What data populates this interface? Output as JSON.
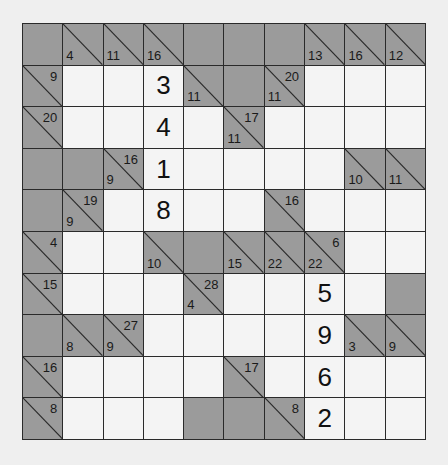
{
  "puzzle": {
    "type": "kakuro",
    "rows": 10,
    "cols": 10,
    "colors": {
      "block": "#9b9b9b",
      "white": "#f4f4f4",
      "lines": "#2a2a2a",
      "background": "#efefef"
    },
    "grid": [
      [
        {
          "t": "b"
        },
        {
          "t": "c",
          "down": "4"
        },
        {
          "t": "c",
          "down": "11"
        },
        {
          "t": "c",
          "down": "16"
        },
        {
          "t": "b"
        },
        {
          "t": "b"
        },
        {
          "t": "b"
        },
        {
          "t": "c",
          "down": "13"
        },
        {
          "t": "c",
          "down": "16"
        },
        {
          "t": "c",
          "down": "12"
        }
      ],
      [
        {
          "t": "c",
          "across": "9"
        },
        {
          "t": "w",
          "v": ""
        },
        {
          "t": "w",
          "v": ""
        },
        {
          "t": "w",
          "v": "3"
        },
        {
          "t": "c",
          "down": "11"
        },
        {
          "t": "b"
        },
        {
          "t": "c",
          "across": "20",
          "down": "11"
        },
        {
          "t": "w",
          "v": ""
        },
        {
          "t": "w",
          "v": ""
        },
        {
          "t": "w",
          "v": ""
        }
      ],
      [
        {
          "t": "c",
          "across": "20"
        },
        {
          "t": "w",
          "v": ""
        },
        {
          "t": "w",
          "v": ""
        },
        {
          "t": "w",
          "v": "4"
        },
        {
          "t": "w",
          "v": ""
        },
        {
          "t": "c",
          "across": "17",
          "down": "11"
        },
        {
          "t": "w",
          "v": ""
        },
        {
          "t": "w",
          "v": ""
        },
        {
          "t": "w",
          "v": ""
        },
        {
          "t": "w",
          "v": ""
        }
      ],
      [
        {
          "t": "b"
        },
        {
          "t": "b"
        },
        {
          "t": "c",
          "across": "16",
          "down": "9"
        },
        {
          "t": "w",
          "v": "1"
        },
        {
          "t": "w",
          "v": ""
        },
        {
          "t": "w",
          "v": ""
        },
        {
          "t": "w",
          "v": ""
        },
        {
          "t": "w",
          "v": ""
        },
        {
          "t": "c",
          "down": "10"
        },
        {
          "t": "c",
          "down": "11"
        }
      ],
      [
        {
          "t": "b"
        },
        {
          "t": "c",
          "across": "19",
          "down": "9"
        },
        {
          "t": "w",
          "v": ""
        },
        {
          "t": "w",
          "v": "8"
        },
        {
          "t": "w",
          "v": ""
        },
        {
          "t": "w",
          "v": ""
        },
        {
          "t": "c",
          "across": "16"
        },
        {
          "t": "w",
          "v": ""
        },
        {
          "t": "w",
          "v": ""
        },
        {
          "t": "w",
          "v": ""
        }
      ],
      [
        {
          "t": "c",
          "across": "4"
        },
        {
          "t": "w",
          "v": ""
        },
        {
          "t": "w",
          "v": ""
        },
        {
          "t": "c",
          "down": "10"
        },
        {
          "t": "b"
        },
        {
          "t": "c",
          "down": "15"
        },
        {
          "t": "c",
          "down": "22"
        },
        {
          "t": "c",
          "across": "6",
          "down": "22"
        },
        {
          "t": "w",
          "v": ""
        },
        {
          "t": "w",
          "v": ""
        }
      ],
      [
        {
          "t": "c",
          "across": "15"
        },
        {
          "t": "w",
          "v": ""
        },
        {
          "t": "w",
          "v": ""
        },
        {
          "t": "w",
          "v": ""
        },
        {
          "t": "c",
          "across": "28",
          "down": "4"
        },
        {
          "t": "w",
          "v": ""
        },
        {
          "t": "w",
          "v": ""
        },
        {
          "t": "w",
          "v": "5"
        },
        {
          "t": "w",
          "v": ""
        },
        {
          "t": "b"
        }
      ],
      [
        {
          "t": "b"
        },
        {
          "t": "c",
          "down": "8"
        },
        {
          "t": "c",
          "across": "27",
          "down": "9"
        },
        {
          "t": "w",
          "v": ""
        },
        {
          "t": "w",
          "v": ""
        },
        {
          "t": "w",
          "v": ""
        },
        {
          "t": "w",
          "v": ""
        },
        {
          "t": "w",
          "v": "9"
        },
        {
          "t": "c",
          "down": "3"
        },
        {
          "t": "c",
          "down": "9"
        }
      ],
      [
        {
          "t": "c",
          "across": "16"
        },
        {
          "t": "w",
          "v": ""
        },
        {
          "t": "w",
          "v": ""
        },
        {
          "t": "w",
          "v": ""
        },
        {
          "t": "w",
          "v": ""
        },
        {
          "t": "c",
          "across": "17"
        },
        {
          "t": "w",
          "v": ""
        },
        {
          "t": "w",
          "v": "6"
        },
        {
          "t": "w",
          "v": ""
        },
        {
          "t": "w",
          "v": ""
        }
      ],
      [
        {
          "t": "c",
          "across": "8"
        },
        {
          "t": "w",
          "v": ""
        },
        {
          "t": "w",
          "v": ""
        },
        {
          "t": "w",
          "v": ""
        },
        {
          "t": "b"
        },
        {
          "t": "b"
        },
        {
          "t": "c",
          "across": "8"
        },
        {
          "t": "w",
          "v": "2"
        },
        {
          "t": "w",
          "v": ""
        },
        {
          "t": "w",
          "v": ""
        }
      ]
    ]
  }
}
